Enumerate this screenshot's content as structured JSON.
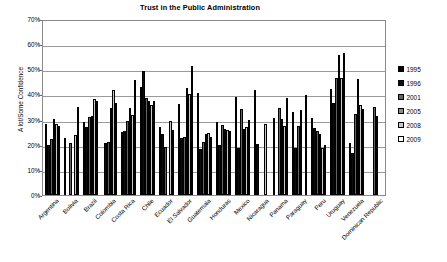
{
  "chart_data": {
    "type": "bar",
    "title": "Trust in the Public Administration",
    "xlabel": "",
    "ylabel": "A lot/Some Confidence",
    "ylim": [
      0,
      70
    ],
    "ytick_labels": [
      "70%",
      "60%",
      "50%",
      "40%",
      "30%",
      "20%",
      "10%",
      "0%"
    ],
    "ytick_values": [
      70,
      60,
      50,
      40,
      30,
      20,
      10,
      0
    ],
    "grid": true,
    "legend_position": "right",
    "categories": [
      "Argentina",
      "Bolivia",
      "Brazil",
      "Colombia",
      "Costa Rica",
      "Chile",
      "Ecuador",
      "El Salvador",
      "Guatemala",
      "Honduras",
      "Mexico",
      "Nicaragua",
      "Panama",
      "Paraguay",
      "Peru",
      "Uruguay",
      "Venezuela",
      "Dominican Republic"
    ],
    "series": [
      {
        "name": "1995",
        "color": "#000000",
        "values": [
          28.3,
          22.6,
          29.1,
          null,
          25.2,
          42.8,
          27.0,
          36.3,
          40.4,
          29.2,
          38.8,
          41.9,
          30.7,
          33.1,
          30.6,
          42.1,
          20.7,
          null
        ]
      },
      {
        "name": "1996",
        "color": "#0d0d0d",
        "values": [
          19.8,
          null,
          27.1,
          20.6,
          25.5,
          49.3,
          24.1,
          22.7,
          18.2,
          20.0,
          18.6,
          20.4,
          null,
          18.7,
          26.5,
          36.7,
          16.9,
          null
        ]
      },
      {
        "name": "2001",
        "color": "#646464",
        "values": [
          22.3,
          20.6,
          31.2,
          21.0,
          29.6,
          38.5,
          19.2,
          23.1,
          21.2,
          27.8,
          34.2,
          null,
          34.8,
          27.4,
          25.4,
          46.4,
          32.3,
          35.0
        ]
      },
      {
        "name": "2005",
        "color": "#8c8c8c",
        "values": [
          30.4,
          null,
          31.5,
          34.5,
          34.5,
          37.3,
          null,
          42.7,
          24.3,
          26.2,
          26.4,
          null,
          30.4,
          33.7,
          24.2,
          55.6,
          46.2,
          31.3
        ]
      },
      {
        "name": "2008",
        "color": "#c8c8c8",
        "values": [
          28.4,
          23.9,
          38.2,
          41.6,
          31.9,
          35.9,
          29.5,
          40.0,
          24.7,
          26.0,
          27.0,
          28.3,
          27.5,
          null,
          18.7,
          46.5,
          36.0,
          null
        ]
      },
      {
        "name": "2009",
        "color": "#ffffff",
        "values": [
          27.6,
          35.2,
          37.3,
          36.5,
          45.6,
          37.4,
          25.9,
          51.3,
          23.0,
          25.5,
          29.7,
          null,
          38.7,
          39.6,
          19.7,
          56.6,
          34.4,
          null
        ]
      }
    ]
  },
  "legend": {
    "entries": [
      {
        "label": "1995"
      },
      {
        "label": "1996"
      },
      {
        "label": "2001"
      },
      {
        "label": "2005"
      },
      {
        "label": "2008"
      },
      {
        "label": "2009"
      }
    ]
  }
}
